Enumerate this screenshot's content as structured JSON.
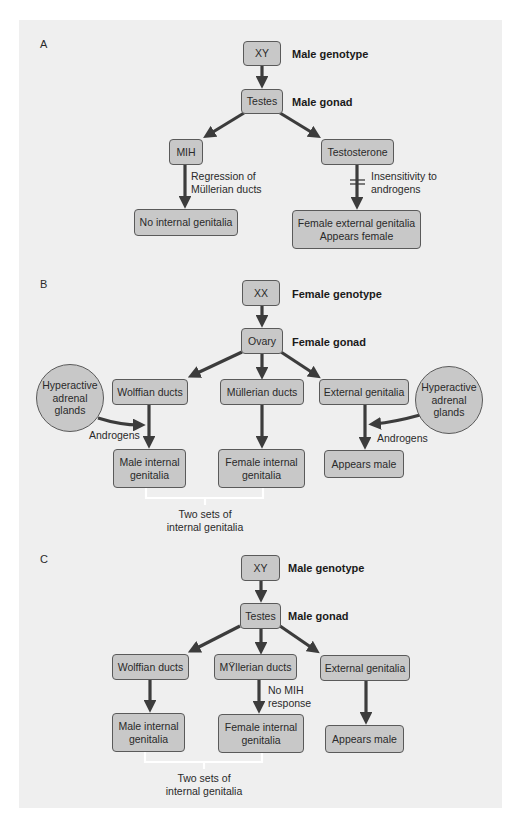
{
  "panels": {
    "A": {
      "letter": "A",
      "genotype_box": "XY",
      "genotype_label": "Male genotype",
      "gonad_box": "Testes",
      "gonad_label": "Male gonad",
      "left_hormone": "MIH",
      "right_hormone": "Testosterone",
      "left_annotation_1": "Regression of",
      "left_annotation_2": "Müllerian ducts",
      "right_annotation_1": "Insensitivity to",
      "right_annotation_2": "androgens",
      "left_outcome": "No internal genitalia",
      "right_outcome_1": "Female external genitalia",
      "right_outcome_2": "Appears female"
    },
    "B": {
      "letter": "B",
      "genotype_box": "XX",
      "genotype_label": "Female genotype",
      "gonad_box": "Ovary",
      "gonad_label": "Female gonad",
      "ducts": [
        "Wolffian ducts",
        "Müllerian ducts",
        "External genitalia"
      ],
      "adrenal_left": [
        "Hyperactive",
        "adrenal",
        "glands"
      ],
      "adrenal_right": [
        "Hyperactive",
        "adrenal",
        "glands"
      ],
      "androgens_left": "Androgens",
      "androgens_right": "Androgens",
      "outcome_male_internal": [
        "Male internal",
        "genitalia"
      ],
      "outcome_female_internal": [
        "Female internal",
        "genitalia"
      ],
      "outcome_appears": "Appears male",
      "bracket_label": [
        "Two sets of",
        "internal genitalia"
      ]
    },
    "C": {
      "letter": "C",
      "genotype_box": "XY",
      "genotype_label": "Male genotype",
      "gonad_box": "Testes",
      "gonad_label": "Male gonad",
      "ducts": [
        "Wolffian ducts",
        "MŸllerian ducts",
        "External genitalia"
      ],
      "mih_annotation": [
        "No MIH",
        "response"
      ],
      "outcome_male_internal": [
        "Male internal",
        "genitalia"
      ],
      "outcome_female_internal": [
        "Female internal",
        "genitalia"
      ],
      "outcome_appears": "Appears male",
      "bracket_label": [
        "Two sets of",
        "internal genitalia"
      ]
    }
  },
  "colors": {
    "background": "#efefef",
    "box_fill": "#c8c8c8",
    "box_border": "#5a5a5a",
    "arrow": "#3c3c3c",
    "bracket": "#ffffff"
  }
}
